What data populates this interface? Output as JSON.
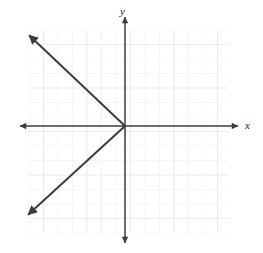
{
  "figure": {
    "kind": "coordinate-plane-graph",
    "width": 263,
    "height": 253,
    "background_color": "#ffffff"
  },
  "axis_labels": {
    "x": "x",
    "y": "y"
  },
  "colors": {
    "grid_minor": "#e8eef2",
    "grid_major": "#dfe7ed",
    "axis": "#3c3c3c",
    "ray": "#3c3c3c",
    "label": "#1a1a1a"
  },
  "chart_data": {
    "type": "line",
    "title": "",
    "xlabel": "x",
    "ylabel": "y",
    "grid": true,
    "legend_position": "none",
    "axis_arrows": "both-ends",
    "origin_px": [
      125,
      126
    ],
    "grid_spacing_px": 14.5,
    "grid_bounds_px": {
      "left": 28,
      "top": 30,
      "right": 229,
      "bottom": 233
    },
    "xlim": [
      -6.7,
      7.2
    ],
    "ylim": [
      -7.4,
      6.6
    ],
    "tick_labels_shown": false,
    "series": [
      {
        "name": "upper-left ray",
        "description": "ray from origin toward upper left, slope -1",
        "x": [
          0,
          -6.4
        ],
        "y": [
          0,
          6.1
        ],
        "start_px": [
          125,
          126
        ],
        "end_px": [
          32,
          38
        ],
        "arrow": "end"
      },
      {
        "name": "lower-left ray",
        "description": "ray from origin toward lower left, slope 1",
        "x": [
          0,
          -6.5
        ],
        "y": [
          0,
          -5.9
        ],
        "start_px": [
          125,
          126
        ],
        "end_px": [
          31,
          212
        ],
        "arrow": "end"
      }
    ],
    "annotations": []
  }
}
